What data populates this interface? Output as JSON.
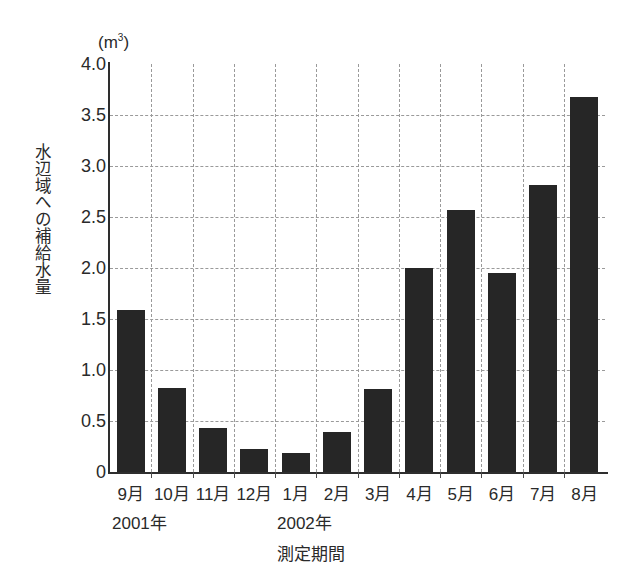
{
  "chart_data": {
    "type": "bar",
    "title": "",
    "subtitle": "",
    "unit_label": "(m³)",
    "unit_base": "(m",
    "unit_sup": "3",
    "unit_close": ")",
    "xlabel": "測定期間",
    "ylabel": "水辺域への補給水量",
    "categories": [
      "9月",
      "10月",
      "11月",
      "12月",
      "1月",
      "2月",
      "3月",
      "4月",
      "5月",
      "6月",
      "7月",
      "8月"
    ],
    "values": [
      1.59,
      0.82,
      0.43,
      0.23,
      0.19,
      0.39,
      0.81,
      2.0,
      2.57,
      1.95,
      2.81,
      3.68
    ],
    "ylim": [
      0,
      4.0
    ],
    "yticks": [
      0,
      0.5,
      1.0,
      1.5,
      2.0,
      2.5,
      3.0,
      3.5,
      4.0
    ],
    "ytick_labels": [
      "0",
      "0.5",
      "1.0",
      "1.5",
      "2.0",
      "2.5",
      "3.0",
      "3.5",
      "4.0"
    ],
    "grid": true,
    "grid_style": "dashed",
    "legend": "none",
    "bar_color": "#262626",
    "grid_color": "#9a9a9a",
    "axis_color": "#2e2e2e",
    "group_labels": [
      {
        "label": "2001年",
        "start_category": "9月"
      },
      {
        "label": "2002年",
        "start_category": "1月"
      }
    ]
  }
}
